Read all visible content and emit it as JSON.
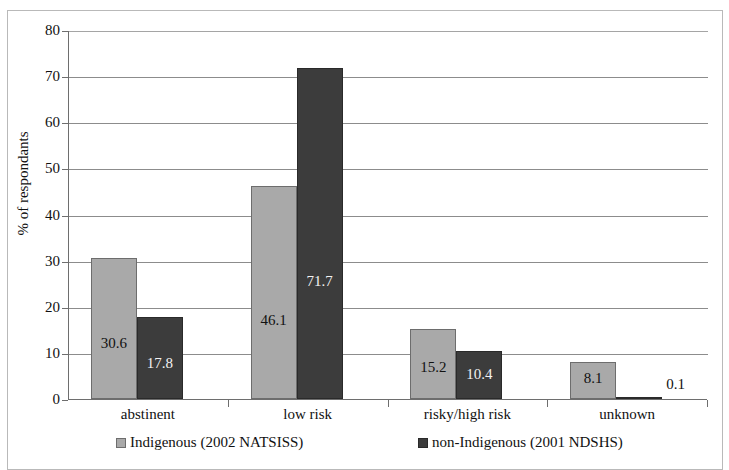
{
  "chart_data": {
    "type": "bar",
    "title": "",
    "xlabel": "",
    "ylabel": "% of respondants",
    "ylim": [
      0,
      80
    ],
    "ytick_step": 10,
    "yticks": [
      "0",
      "10",
      "20",
      "30",
      "40",
      "50",
      "60",
      "70",
      "80"
    ],
    "grid": true,
    "legend_position": "bottom",
    "categories": [
      "abstinent",
      "low risk",
      "risky/high risk",
      "unknown"
    ],
    "series": [
      {
        "name": "Indigenous (2002 NATSISS)",
        "color": "#a9a9a9",
        "values": [
          30.6,
          46.1,
          15.2,
          8.1
        ],
        "labels": [
          "30.6",
          "46.1",
          "15.2",
          "8.1"
        ]
      },
      {
        "name": "non-Indigenous (2001 NDSHS)",
        "color": "#3c3c3c",
        "values": [
          17.8,
          71.7,
          10.4,
          0.1
        ],
        "labels": [
          "17.8",
          "71.7",
          "10.4",
          "0.1"
        ]
      }
    ]
  },
  "axis": {
    "y_title": "% of respondants",
    "y_max": 80,
    "y_min": 0
  },
  "colors": {
    "series_a": "#a9a9a9",
    "series_b": "#3c3c3c",
    "grid": "#8c8c8c",
    "axis": "#6e6e6e",
    "frame": "#b9b9b9",
    "background": "#ffffff"
  }
}
